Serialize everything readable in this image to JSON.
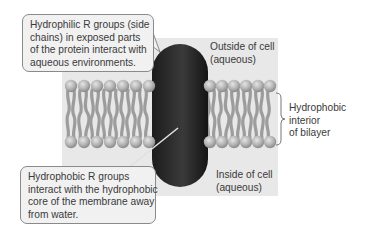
{
  "figure": {
    "callouts": {
      "hydrophilic": {
        "lines": [
          "Hydrophilic R groups (side",
          "chains) in exposed parts",
          "of the protein interact with",
          "aqueous environments."
        ]
      },
      "hydrophobic": {
        "lines": [
          "Hydrophobic R groups",
          "interact with the hydrophobic",
          "core of the membrane away",
          "from water."
        ]
      }
    },
    "labels": {
      "outside": [
        "Outside of cell",
        "(aqueous)"
      ],
      "inside": [
        "Inside of cell",
        "(aqueous)"
      ],
      "bilayer_interior": [
        "Hydrophobic",
        "interior",
        "of bilayer"
      ]
    },
    "colors": {
      "panel": "#e8e8e8",
      "protein": "#2a2a2a",
      "lipid_head": "#b5b5b5",
      "lipid_tail": "#9a9a9a",
      "callout_bg": "#f1f1f1",
      "callout_border": "#8a8a8a"
    }
  }
}
